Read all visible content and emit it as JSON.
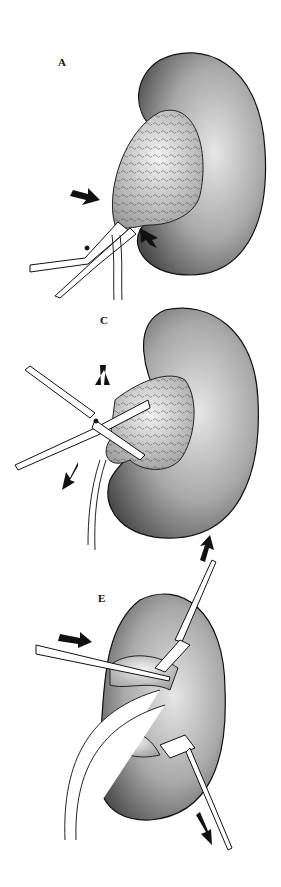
{
  "figure": {
    "panels": [
      {
        "label": "A",
        "description": "Kidney with tumor mass grasped by clamp; arrows indicate traction direction"
      },
      {
        "label": "C",
        "description": "Scissors dissecting tumor from renal hilum; arrows indicate retraction"
      },
      {
        "label": "E",
        "description": "Retractors spreading kidney parenchyma with instrument inserted; ureter visible"
      }
    ]
  },
  "colors": {
    "ink": "#111111",
    "stipple": "#555555",
    "background": "#ffffff"
  }
}
